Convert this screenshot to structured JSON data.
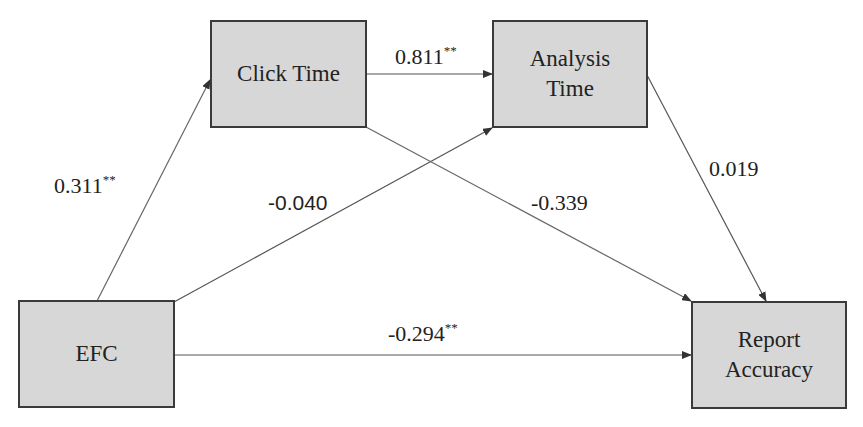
{
  "diagram": {
    "type": "path-diagram",
    "nodes": [
      {
        "id": "efc",
        "label": "EFC"
      },
      {
        "id": "click_time",
        "label": "Click Time"
      },
      {
        "id": "analysis_time",
        "label_line1": "Analysis",
        "label_line2": "Time"
      },
      {
        "id": "report_accuracy",
        "label_line1": "Report",
        "label_line2": "Accuracy"
      }
    ],
    "edges": [
      {
        "from": "efc",
        "to": "click_time",
        "coef": "0.311",
        "sig": "**"
      },
      {
        "from": "click_time",
        "to": "analysis_time",
        "coef": "0.811",
        "sig": "**"
      },
      {
        "from": "efc",
        "to": "analysis_time",
        "coef": "-0.040",
        "sig": ""
      },
      {
        "from": "click_time",
        "to": "report_accuracy",
        "coef": "-0.339",
        "sig": ""
      },
      {
        "from": "analysis_time",
        "to": "report_accuracy",
        "coef": "0.019",
        "sig": ""
      },
      {
        "from": "efc",
        "to": "report_accuracy",
        "coef": "-0.294",
        "sig": "**"
      }
    ],
    "colors": {
      "box_fill": "#d7d7d7",
      "box_border": "#3a3a3a",
      "line": "#555555"
    }
  }
}
